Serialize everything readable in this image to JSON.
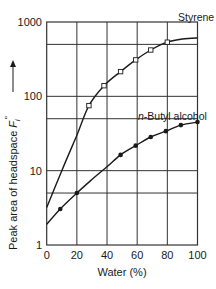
{
  "chart_data": {
    "type": "line",
    "title": "",
    "xlabel": "Water (%)",
    "ylabel": "Peak area of headspace F_i''",
    "ylabel_parts": {
      "main": "Peak area of headspace ",
      "symbol": "F",
      "subscript": "i",
      "prime": "''",
      "arrow": "⟶"
    },
    "xlim": [
      0,
      100
    ],
    "ylim": [
      1,
      1000
    ],
    "yscale": "log",
    "grid": true,
    "x_ticks": [
      0,
      20,
      40,
      60,
      80,
      100
    ],
    "x_tick_labels": [
      "0",
      "20",
      "40",
      "60",
      "80",
      "100"
    ],
    "y_ticks": [
      1,
      10,
      100,
      1000
    ],
    "y_tick_labels": [
      "1",
      "10",
      "100",
      "1000"
    ],
    "y_minor_grid": [
      5,
      50,
      500
    ],
    "legend": "inline labels",
    "series": [
      {
        "name": "Styrene",
        "marker": "open-square",
        "curve": [
          [
            0,
            3.2
          ],
          [
            10,
            10
          ],
          [
            20,
            30
          ],
          [
            28,
            75
          ],
          [
            38,
            139
          ],
          [
            49,
            215
          ],
          [
            59,
            309
          ],
          [
            69,
            420
          ],
          [
            80,
            535
          ],
          [
            90,
            590
          ],
          [
            100,
            610
          ]
        ],
        "points": [
          [
            28,
            75
          ],
          [
            38,
            139
          ],
          [
            49,
            215
          ],
          [
            59,
            309
          ],
          [
            69,
            420
          ],
          [
            80,
            535
          ]
        ]
      },
      {
        "name": "n-Butyl alcohol",
        "name_italic_prefix": "n",
        "name_rest": "-Butyl alcohol",
        "marker": "filled-circle",
        "curve": [
          [
            0,
            1.9
          ],
          [
            9,
            3.05
          ],
          [
            20,
            5.0
          ],
          [
            30,
            7.6
          ],
          [
            40,
            11.3
          ],
          [
            49,
            16.3
          ],
          [
            59,
            21.7
          ],
          [
            69,
            28.4
          ],
          [
            79,
            34
          ],
          [
            89,
            41
          ],
          [
            100,
            45
          ]
        ],
        "points": [
          [
            9,
            3.05
          ],
          [
            20,
            5.0
          ],
          [
            49,
            16.3
          ],
          [
            59,
            21.7
          ],
          [
            69,
            28.4
          ],
          [
            79,
            34
          ],
          [
            89,
            41
          ],
          [
            100,
            45
          ]
        ]
      }
    ]
  },
  "colors": {
    "line": "#1a1a1a",
    "grid": "#333333",
    "background": "#ffffff"
  }
}
